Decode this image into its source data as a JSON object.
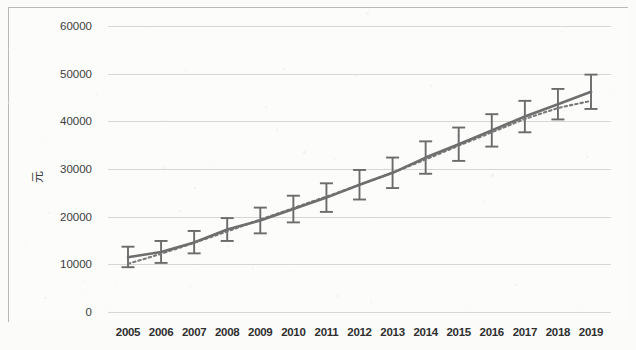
{
  "chart_data": {
    "type": "line",
    "title": "",
    "subtitle": "",
    "xlabel": "",
    "ylabel": "元",
    "grid": true,
    "legend": "none",
    "ylim": [
      0,
      60000
    ],
    "ytick_values": [
      0,
      10000,
      20000,
      30000,
      40000,
      50000,
      60000
    ],
    "ytick_labels": [
      "0",
      "10000",
      "20000",
      "30000",
      "40000",
      "50000",
      "60000"
    ],
    "categories": [
      "2005",
      "2006",
      "2007",
      "2008",
      "2009",
      "2010",
      "2011",
      "2012",
      "2013",
      "2014",
      "2015",
      "2016",
      "2017",
      "2018",
      "2019"
    ],
    "series": [
      {
        "name": "观测值",
        "style": "solid",
        "color": "#6e6e6e",
        "values": [
          11500,
          12600,
          14600,
          17300,
          19200,
          21600,
          24000,
          26700,
          29200,
          32400,
          35200,
          38100,
          41000,
          43600,
          46200
        ],
        "error_low": [
          9400,
          10300,
          12300,
          14900,
          16500,
          18800,
          21000,
          23600,
          26000,
          29000,
          31700,
          34700,
          37700,
          40400,
          42600
        ],
        "error_high": [
          13700,
          14900,
          17000,
          19700,
          21900,
          24400,
          27000,
          29800,
          32400,
          35800,
          38700,
          41500,
          44300,
          46800,
          49800
        ]
      },
      {
        "name": "拟合趋势线",
        "style": "dotted",
        "color": "#7a7a7a",
        "values": [
          10100,
          12200,
          14500,
          16900,
          19400,
          21800,
          24200,
          26700,
          29200,
          32000,
          34900,
          37700,
          40500,
          42800,
          44300
        ]
      }
    ]
  },
  "axes": {
    "y_title": "元",
    "x_tick_labels": [
      "2005",
      "2006",
      "2007",
      "2008",
      "2009",
      "2010",
      "2011",
      "2012",
      "2013",
      "2014",
      "2015",
      "2016",
      "2017",
      "2018",
      "2019"
    ],
    "y_tick_labels": [
      "60000",
      "50000",
      "40000",
      "30000",
      "20000",
      "10000",
      "0"
    ]
  }
}
